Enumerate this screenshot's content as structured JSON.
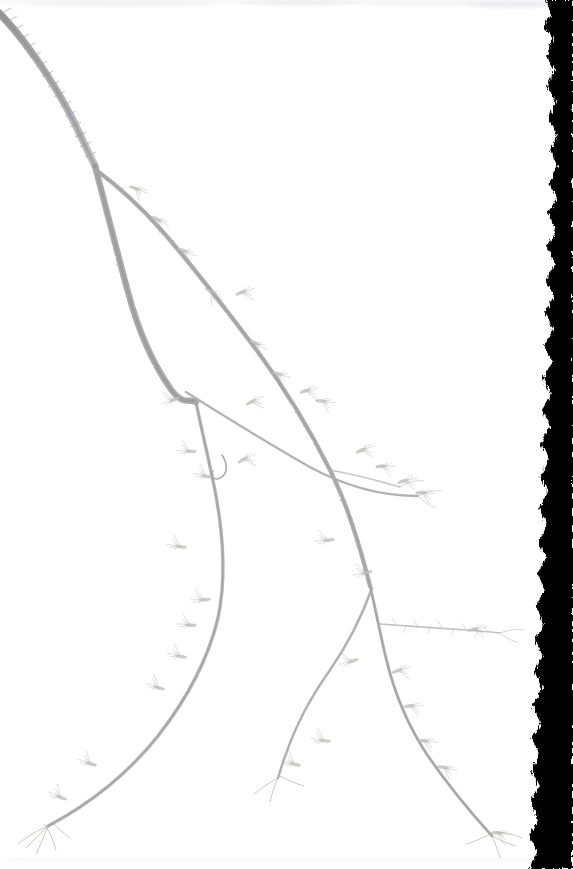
{
  "image": {
    "kind": "herbarium-specimen-scan",
    "subject": "woody-branch-with-buds",
    "width_px": 573,
    "height_px": 869,
    "orientation": "portrait"
  },
  "colors": {
    "background": "#ffffff",
    "paper": "#fefefe",
    "border_black": "#000000",
    "stem_dark": "#8e8e92",
    "stem_mid": "#a9a9ad",
    "stem_light": "#c2c2c6",
    "twig_fine": "#b6b6ba",
    "bud_tan": "#c9c3bb",
    "bud_shadow": "#aeaaa4",
    "smudge_gray": "#e2e2e4",
    "lenticel": "#9b9b9f"
  },
  "regions": {
    "specimen_area": "left-and-center",
    "torn_edge": "right",
    "torn_edge_label": "ragged black scan border",
    "top_smudge_label": "faint gray smudge band at top edge",
    "bottom_edge_label": "faint paper edge line at bottom"
  },
  "specimen": {
    "main_stem_label": "main woody stem entering from upper-left corner",
    "forks": [
      {
        "name": "fork-upper",
        "x": 95,
        "y": 165,
        "note": "first branching node"
      },
      {
        "name": "fork-mid",
        "x": 195,
        "y": 400,
        "note": "second branching node"
      },
      {
        "name": "fork-lower-right",
        "x": 372,
        "y": 585,
        "note": "lower right branching node"
      },
      {
        "name": "fork-horizontal-twig",
        "x": 380,
        "y": 622,
        "note": "node of horizontal twig"
      }
    ],
    "tips": [
      {
        "name": "tip-lower-left",
        "x": 40,
        "y": 828
      },
      {
        "name": "tip-bottom-center",
        "x": 278,
        "y": 778
      },
      {
        "name": "tip-lower-right",
        "x": 492,
        "y": 835
      },
      {
        "name": "tip-horizontal-right",
        "x": 498,
        "y": 632
      },
      {
        "name": "tip-upper-right",
        "x": 418,
        "y": 495
      }
    ],
    "feature_counts": {
      "visible_buds": 34,
      "major_branches": 5,
      "fine_twigs": 9
    }
  },
  "branches": [
    {
      "name": "main-stem",
      "d": "M -8 6 C 22 34, 54 82, 74 122 C 84 143, 90 156, 95 166",
      "w": 7.4,
      "color": "#9a9a9e"
    },
    {
      "name": "stem-left-descend",
      "d": "M 95 166 C 104 200, 116 248, 128 292 C 138 330, 152 362, 170 388 C 183 407, 190 398, 196 402",
      "w": 6.4,
      "color": "#a2a2a6"
    },
    {
      "name": "branch-right-upper",
      "d": "M 96 170 C 118 186, 140 206, 163 232 C 196 270, 228 312, 258 352 C 286 390, 310 430, 330 470 C 348 506, 360 546, 370 586",
      "w": 4.4,
      "color": "#a8a8ac"
    },
    {
      "name": "branch-left-long",
      "d": "M 196 402 C 202 432, 210 464, 216 496 C 224 540, 226 580, 218 618 C 208 660, 186 700, 158 736 C 126 776, 86 806, 48 826",
      "w": 3.4,
      "color": "#aeaeb2"
    },
    {
      "name": "branch-mid-diagonal",
      "d": "M 186 392 C 224 416, 266 442, 308 466 C 344 486, 382 496, 418 496",
      "w": 2.5,
      "color": "#b2b2b6"
    },
    {
      "name": "branch-right-lower",
      "d": "M 370 586 C 376 610, 380 634, 386 658 C 394 692, 408 726, 428 756 C 450 788, 472 814, 492 836",
      "w": 3.0,
      "color": "#aaaaae"
    },
    {
      "name": "branch-bottom-left-of-fork",
      "d": "M 372 588 C 362 616, 348 644, 330 670 C 312 696, 294 724, 278 778",
      "w": 2.6,
      "color": "#b0b0b4"
    },
    {
      "name": "twig-horizontal",
      "d": "M 380 624 C 406 626, 438 628, 466 630 C 480 631, 490 632, 500 633",
      "w": 1.7,
      "color": "#b8b8bc"
    },
    {
      "name": "twig-upper-right-spur",
      "d": "M 330 470 C 352 474, 376 480, 400 487",
      "w": 1.5,
      "color": "#bcbcc0"
    }
  ],
  "buds": [
    {
      "x": 130,
      "y": 186,
      "a": 28
    },
    {
      "x": 152,
      "y": 216,
      "a": 36
    },
    {
      "x": 178,
      "y": 248,
      "a": 30
    },
    {
      "x": 206,
      "y": 288,
      "a": 40
    },
    {
      "x": 236,
      "y": 294,
      "a": -12
    },
    {
      "x": 250,
      "y": 340,
      "a": 34
    },
    {
      "x": 272,
      "y": 372,
      "a": 22
    },
    {
      "x": 300,
      "y": 392,
      "a": -8
    },
    {
      "x": 316,
      "y": 400,
      "a": 14
    },
    {
      "x": 246,
      "y": 404,
      "a": -18
    },
    {
      "x": 180,
      "y": 398,
      "a": 168
    },
    {
      "x": 196,
      "y": 452,
      "a": 190
    },
    {
      "x": 238,
      "y": 462,
      "a": -20
    },
    {
      "x": 212,
      "y": 478,
      "a": 200
    },
    {
      "x": 356,
      "y": 452,
      "a": -14
    },
    {
      "x": 376,
      "y": 466,
      "a": 6
    },
    {
      "x": 398,
      "y": 482,
      "a": -6
    },
    {
      "x": 416,
      "y": 492,
      "a": 10
    },
    {
      "x": 334,
      "y": 540,
      "a": 182
    },
    {
      "x": 186,
      "y": 548,
      "a": 196
    },
    {
      "x": 210,
      "y": 600,
      "a": 186
    },
    {
      "x": 196,
      "y": 626,
      "a": 192
    },
    {
      "x": 186,
      "y": 658,
      "a": 200
    },
    {
      "x": 164,
      "y": 690,
      "a": 206
    },
    {
      "x": 372,
      "y": 572,
      "a": 176
    },
    {
      "x": 358,
      "y": 660,
      "a": 172
    },
    {
      "x": 392,
      "y": 672,
      "a": -10
    },
    {
      "x": 404,
      "y": 706,
      "a": 4
    },
    {
      "x": 418,
      "y": 740,
      "a": 12
    },
    {
      "x": 438,
      "y": 766,
      "a": 18
    },
    {
      "x": 330,
      "y": 742,
      "a": 196
    },
    {
      "x": 300,
      "y": 766,
      "a": 202
    },
    {
      "x": 96,
      "y": 766,
      "a": 206
    },
    {
      "x": 66,
      "y": 800,
      "a": 210
    },
    {
      "x": 492,
      "y": 832,
      "a": 14
    },
    {
      "x": 468,
      "y": 630,
      "a": -4
    }
  ],
  "torn_edge_path": "M 573 0 L 545 0 L 552 14 L 544 26 L 553 40 L 546 56 L 555 70 L 547 86 L 556 102 L 548 118 L 557 134 L 550 150 L 558 166 L 549 182 L 557 198 L 548 214 L 556 230 L 547 248 L 555 264 L 546 280 L 554 296 L 545 312 L 553 330 L 544 346 L 552 362 L 543 378 L 551 394 L 542 410 L 550 426 L 541 444 L 549 460 L 540 476 L 548 492 L 539 508 L 547 526 L 538 542 L 546 558 L 537 574 L 545 590 L 536 606 L 544 624 L 535 640 L 543 656 L 534 672 L 542 688 L 533 706 L 541 722 L 532 738 L 540 754 L 531 770 L 539 786 L 530 802 L 538 820 L 529 836 L 537 852 L 530 869 L 573 869 Z",
  "accessibility": {
    "alt_text": "Scanned herbarium sheet showing a slender woody branch with alternate buds, entering from the upper left and splitting into several drooping twigs, against a white paper background with a ragged black border along the right edge."
  }
}
